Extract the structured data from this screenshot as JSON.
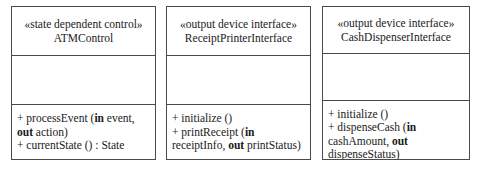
{
  "diagram": {
    "kind": "uml-class-diagram",
    "border_color": "#4a4a4a",
    "background_color": "#ffffff",
    "text_color": "#1a1a1a"
  },
  "classes": [
    {
      "stereotype": "«state dependent control»",
      "name": "ATMControl",
      "attributes": [],
      "operations": [
        {
          "prefix": "+ processEvent (",
          "kw1": "in",
          "mid": " event, ",
          "kw2": "out",
          "tail": " action)"
        },
        {
          "prefix": "+ currentState () : State",
          "kw1": "",
          "mid": "",
          "kw2": "",
          "tail": ""
        }
      ]
    },
    {
      "stereotype": "«output device interface»",
      "name": "ReceiptPrinterInterface",
      "attributes": [],
      "operations": [
        {
          "prefix": "+ initialize ()",
          "kw1": "",
          "mid": "",
          "kw2": "",
          "tail": ""
        },
        {
          "prefix": "+ printReceipt (",
          "kw1": "in",
          "mid": " receiptInfo, ",
          "kw2": "out",
          "tail": " printStatus)"
        }
      ]
    },
    {
      "stereotype": "«output device interface»",
      "name": "CashDispenserInterface",
      "attributes": [],
      "operations": [
        {
          "prefix": "+ initialize ()",
          "kw1": "",
          "mid": "",
          "kw2": "",
          "tail": ""
        },
        {
          "prefix": "+ dispenseCash (",
          "kw1": "in",
          "mid": " cashAmount, ",
          "kw2": "out",
          "tail": " dispenseStatus)"
        }
      ]
    }
  ]
}
